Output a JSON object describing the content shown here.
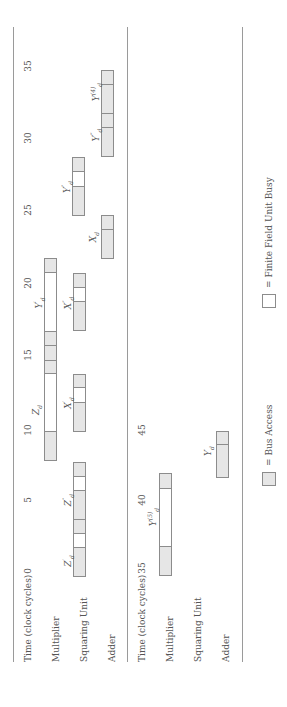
{
  "diagram": {
    "type": "timing-schedule",
    "orientation": "rotated-90-ccw",
    "cycle_px": 14.5,
    "colors": {
      "bus_access": "#e6e6e6",
      "unit_busy": "#ffffff",
      "border": "#8c8c8c",
      "rule": "#9a9a9a"
    },
    "tables": [
      {
        "row_labels": {
          "time": "Time (clock cycles)",
          "multiplier": "Multiplier",
          "squaring": "Squaring Unit",
          "adder": "Adder"
        },
        "start_cycle": 0,
        "ticks": [
          "0",
          "5",
          "10",
          "15",
          "20",
          "25",
          "30",
          "35"
        ],
        "operations": [
          {
            "unit": "squaring",
            "label": "Z'_d",
            "segments": [
              [
                0,
                2,
                "bus"
              ],
              [
                2,
                3,
                "busy"
              ],
              [
                3,
                4,
                "bus"
              ]
            ]
          },
          {
            "unit": "squaring",
            "label": "Z''_d",
            "segments": [
              [
                4,
                6,
                "bus"
              ],
              [
                6,
                7,
                "busy"
              ],
              [
                7,
                8,
                "bus"
              ]
            ]
          },
          {
            "unit": "multiplier",
            "label": "Z_d",
            "segments": [
              [
                8,
                10,
                "bus"
              ],
              [
                10,
                14,
                "busy"
              ],
              [
                14,
                15,
                "bus"
              ]
            ]
          },
          {
            "unit": "squaring",
            "label": "X'_d",
            "segments": [
              [
                10,
                12,
                "bus"
              ],
              [
                12,
                13,
                "busy"
              ],
              [
                13,
                14,
                "bus"
              ]
            ]
          },
          {
            "unit": "multiplier",
            "label": "Y'_d",
            "segments": [
              [
                15,
                16,
                "bus"
              ],
              [
                16,
                17,
                "bus"
              ],
              [
                17,
                21,
                "busy"
              ],
              [
                21,
                22,
                "bus"
              ]
            ]
          },
          {
            "unit": "squaring",
            "label": "X''_d",
            "segments": [
              [
                17,
                19,
                "bus"
              ],
              [
                19,
                20,
                "busy"
              ],
              [
                20,
                21,
                "bus"
              ]
            ]
          },
          {
            "unit": "adder",
            "label": "X_d",
            "segments": [
              [
                22,
                24,
                "bus"
              ],
              [
                24,
                25,
                "bus"
              ]
            ]
          },
          {
            "unit": "squaring",
            "label": "Y''_d",
            "segments": [
              [
                25,
                27,
                "bus"
              ],
              [
                27,
                28,
                "busy"
              ],
              [
                28,
                29,
                "bus"
              ]
            ]
          },
          {
            "unit": "adder",
            "label": "Y'''_d",
            "segments": [
              [
                29,
                31,
                "bus"
              ],
              [
                31,
                32,
                "bus"
              ]
            ]
          },
          {
            "unit": "adder",
            "label": "Y_d^(4)",
            "segments": [
              [
                32,
                34,
                "bus"
              ],
              [
                34,
                35,
                "bus"
              ]
            ]
          }
        ]
      },
      {
        "row_labels": {
          "time": "Time (clock cycles)",
          "multiplier": "Multiplier",
          "squaring": "Squaring Unit",
          "adder": "Adder"
        },
        "start_cycle": 35,
        "ticks": [
          "35",
          "40",
          "45"
        ],
        "operations": [
          {
            "unit": "multiplier",
            "label": "Y_d^(5)",
            "segments": [
              [
                35,
                37,
                "bus"
              ],
              [
                37,
                41,
                "busy"
              ],
              [
                41,
                42,
                "bus"
              ]
            ]
          },
          {
            "unit": "adder",
            "label": "Y_d",
            "segments": [
              [
                42,
                44,
                "bus"
              ],
              [
                44,
                45,
                "bus"
              ]
            ]
          }
        ]
      }
    ],
    "legend": [
      {
        "label": "= Bus Access",
        "swatch": "bus"
      },
      {
        "label": "= Finite Field Unit Busy",
        "swatch": "busy"
      }
    ]
  },
  "labels": {
    "t1_time": "Time (clock cycles)",
    "t1_mult": "Multiplier",
    "t1_sq": "Squaring Unit",
    "t1_add": "Adder",
    "t2_time": "Time (clock cycles)",
    "t2_mult": "Multiplier",
    "t2_sq": "Squaring Unit",
    "t2_add": "Adder",
    "t1_ticks": [
      "0",
      "5",
      "10",
      "15",
      "20",
      "25",
      "30",
      "35"
    ],
    "t2_ticks": [
      "35",
      "40",
      "45"
    ],
    "ops": {
      "zd1": "Z",
      "zd1_sub": "d",
      "zd1_sup": "′",
      "zd2": "Z",
      "zd2_sub": "d",
      "zd2_sup": "″",
      "zd": "Z",
      "zd_sub": "d",
      "xd1": "X",
      "xd1_sub": "d",
      "xd1_sup": "′",
      "yd1": "Y",
      "yd1_sub": "d",
      "yd1_sup": "′",
      "xd2": "X",
      "xd2_sub": "d",
      "xd2_sup": "″",
      "xd": "X",
      "xd_sub": "d",
      "yd2": "Y",
      "yd2_sub": "d",
      "yd2_sup": "″",
      "yd3": "Y",
      "yd3_sub": "d",
      "yd3_sup": "‴",
      "yd4": "Y",
      "yd4_sub": "d",
      "yd4_sup": "(4)",
      "yd5": "Y",
      "yd5_sub": "d",
      "yd5_sup": "(5)",
      "yd": "Y",
      "yd_sub": "d"
    },
    "legend_bus": "= Bus Access",
    "legend_busy": "= Finite Field Unit Busy"
  }
}
